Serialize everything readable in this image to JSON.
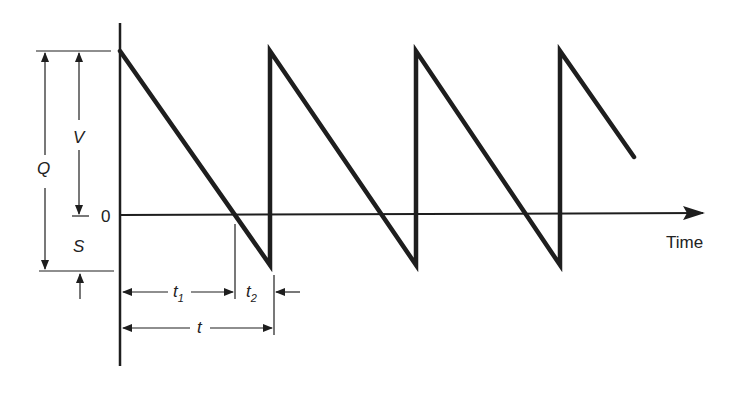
{
  "diagram": {
    "type": "sawtooth-inventory-diagram",
    "axis": {
      "x_label": "Time",
      "zero_label": "0"
    },
    "dimensions": {
      "Q": "Q",
      "V": "V",
      "S": "S",
      "t1": "t",
      "t1_sub": "1",
      "t2": "t",
      "t2_sub": "2",
      "t": "t"
    },
    "colors": {
      "line": "#1e1e1e",
      "background": "#ffffff"
    },
    "waveform": {
      "points": [
        [
          120,
          51
        ],
        [
          270,
          265
        ],
        [
          270,
          51
        ],
        [
          416,
          265
        ],
        [
          416,
          51
        ],
        [
          560,
          265
        ],
        [
          560,
          51
        ],
        [
          634,
          157
        ]
      ]
    }
  }
}
